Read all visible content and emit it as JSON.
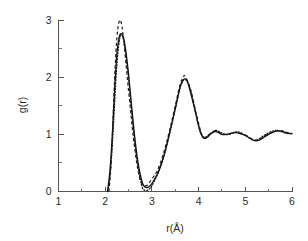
{
  "chart_data": {
    "type": "line",
    "title": "",
    "xlabel": "r(Å)",
    "ylabel": "g(r)",
    "xlim": [
      1,
      6
    ],
    "ylim": [
      0,
      3
    ],
    "grid": false,
    "legend": "none",
    "xticks": [
      1,
      2,
      3,
      4,
      5,
      6
    ],
    "xtick_labels": [
      "1",
      "2",
      "3",
      "4",
      "5",
      "6"
    ],
    "xminor_ticks": [
      1.5,
      2.5,
      3.5,
      4.5,
      5.5
    ],
    "yticks": [
      0,
      1,
      2,
      3
    ],
    "ytick_labels": [
      "0",
      "1",
      "2",
      "3"
    ],
    "yminor_ticks": [
      0.5,
      1.5,
      2.5
    ],
    "series": [
      {
        "name": "solid",
        "style": "solid",
        "color": "#111111",
        "x": [
          2.05,
          2.1,
          2.15,
          2.2,
          2.25,
          2.3,
          2.35,
          2.4,
          2.45,
          2.5,
          2.55,
          2.6,
          2.65,
          2.7,
          2.75,
          2.8,
          2.85,
          2.9,
          2.95,
          3.0,
          3.1,
          3.2,
          3.3,
          3.4,
          3.5,
          3.6,
          3.65,
          3.7,
          3.75,
          3.8,
          3.9,
          4.0,
          4.05,
          4.1,
          4.15,
          4.2,
          4.25,
          4.3,
          4.35,
          4.4,
          4.5,
          4.6,
          4.7,
          4.8,
          4.9,
          5.0,
          5.1,
          5.2,
          5.3,
          5.4,
          5.5,
          5.6,
          5.7,
          5.8,
          5.9,
          6.0
        ],
        "y": [
          0.0,
          0.35,
          0.95,
          1.75,
          2.4,
          2.7,
          2.76,
          2.66,
          2.4,
          2.05,
          1.62,
          1.2,
          0.82,
          0.52,
          0.3,
          0.14,
          0.08,
          0.07,
          0.09,
          0.14,
          0.28,
          0.48,
          0.76,
          1.1,
          1.45,
          1.82,
          1.93,
          1.97,
          1.94,
          1.82,
          1.5,
          1.15,
          1.02,
          0.94,
          0.93,
          0.96,
          1.0,
          1.03,
          1.05,
          1.04,
          1.0,
          1.0,
          1.02,
          1.03,
          1.01,
          0.98,
          0.93,
          0.89,
          0.9,
          0.95,
          1.0,
          1.04,
          1.06,
          1.05,
          1.02,
          1.01
        ]
      },
      {
        "name": "dashed",
        "style": "dashed",
        "color": "#1a1a1a",
        "x": [
          2.08,
          2.12,
          2.16,
          2.2,
          2.24,
          2.28,
          2.32,
          2.36,
          2.4,
          2.45,
          2.5,
          2.55,
          2.6,
          2.65,
          2.7,
          2.75,
          2.8,
          2.85,
          2.9,
          2.95,
          3.0,
          3.1,
          3.2,
          3.3,
          3.4,
          3.5,
          3.6,
          3.68,
          3.72,
          3.78,
          3.85,
          3.95,
          4.05,
          4.1,
          4.15,
          4.2,
          4.25,
          4.3,
          4.35,
          4.4,
          4.5,
          4.6,
          4.7,
          4.8,
          4.9,
          5.0,
          5.1,
          5.2,
          5.3,
          5.4,
          5.5,
          5.6,
          5.7,
          5.8,
          5.9,
          6.0
        ],
        "y": [
          0.0,
          0.4,
          1.1,
          1.95,
          2.58,
          2.9,
          3.0,
          2.88,
          2.62,
          2.18,
          1.76,
          1.36,
          0.96,
          0.64,
          0.38,
          0.2,
          0.12,
          0.1,
          0.11,
          0.16,
          0.22,
          0.34,
          0.54,
          0.82,
          1.14,
          1.5,
          1.86,
          2.02,
          2.0,
          1.9,
          1.72,
          1.36,
          1.04,
          0.96,
          0.94,
          0.97,
          1.01,
          1.04,
          1.06,
          1.05,
          1.01,
          1.0,
          1.02,
          1.04,
          1.02,
          0.99,
          0.94,
          0.9,
          0.91,
          0.96,
          1.01,
          1.05,
          1.07,
          1.06,
          1.03,
          1.02
        ]
      },
      {
        "name": "dotted",
        "style": "dotted",
        "color": "#1a1a1a",
        "x": [
          2.06,
          2.12,
          2.18,
          2.24,
          2.3,
          2.35,
          2.4,
          2.45,
          2.5,
          2.55,
          2.6,
          2.65,
          2.7,
          2.75,
          2.8,
          2.85,
          2.9,
          2.95,
          3.0,
          3.1,
          3.2,
          3.3,
          3.4,
          3.5,
          3.6,
          3.66,
          3.7,
          3.76,
          3.84,
          3.92,
          4.02,
          4.08,
          4.14,
          4.2,
          4.26,
          4.32,
          4.38,
          4.46,
          4.56,
          4.66,
          4.76,
          4.86,
          4.96,
          5.06,
          5.16,
          5.26,
          5.36,
          5.46,
          5.56,
          5.66,
          5.76,
          5.86,
          5.96
        ],
        "y": [
          0.0,
          0.42,
          1.2,
          2.1,
          2.62,
          2.74,
          2.62,
          2.34,
          1.98,
          1.54,
          1.12,
          0.74,
          0.44,
          0.22,
          0.06,
          0.02,
          0.02,
          0.05,
          0.1,
          0.26,
          0.46,
          0.74,
          1.08,
          1.44,
          1.8,
          1.92,
          1.96,
          1.92,
          1.74,
          1.44,
          1.08,
          0.97,
          0.95,
          0.98,
          1.02,
          1.05,
          1.07,
          1.04,
          1.0,
          1.0,
          1.03,
          1.04,
          1.0,
          0.95,
          0.9,
          0.9,
          0.96,
          1.01,
          1.05,
          1.07,
          1.05,
          1.02,
          1.01
        ]
      }
    ]
  }
}
